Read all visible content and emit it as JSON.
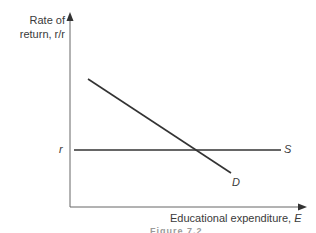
{
  "diagram": {
    "y_axis_label_line1": "Rate of",
    "y_axis_label_line2": "return, r/r",
    "x_axis_label": "Educational expenditure,",
    "x_axis_symbol": "E",
    "r_tick_label": "r",
    "supply_curve_label": "S",
    "demand_curve_label": "D",
    "caption": "Figure 7.2",
    "colors": {
      "axis": "#555555",
      "line": "#333333",
      "text": "#3a3a3a"
    }
  }
}
